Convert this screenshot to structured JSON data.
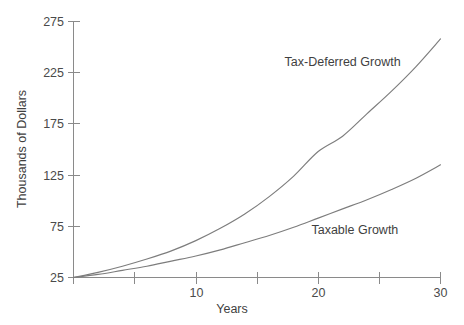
{
  "chart_data": {
    "type": "line",
    "title": "",
    "xlabel": "Years",
    "ylabel": "Thousands of Dollars",
    "xlim": [
      0,
      30
    ],
    "ylim": [
      25,
      275
    ],
    "grid": false,
    "legend_position": "inline-annotation",
    "x_ticks": [
      0,
      5,
      10,
      15,
      20,
      25,
      30
    ],
    "x_tick_labels": [
      "",
      "",
      "10",
      "",
      "20",
      "",
      "30"
    ],
    "y_ticks": [
      25,
      75,
      125,
      175,
      225,
      275
    ],
    "y_tick_labels": [
      "25",
      "75",
      "125",
      "175",
      "225",
      "275"
    ],
    "x": [
      0,
      2,
      4,
      6,
      8,
      10,
      12,
      14,
      16,
      18,
      20,
      22,
      24,
      26,
      28,
      30
    ],
    "series": [
      {
        "name": "Tax-Deferred Growth",
        "color": "#7d7d7d",
        "values": [
          25,
          30,
          36,
          43,
          51,
          61,
          73,
          87,
          104,
          124,
          148,
          163,
          185,
          207,
          231,
          258
        ],
        "label_x": 22,
        "label_y": 232
      },
      {
        "name": "Taxable Growth",
        "color": "#7d7d7d",
        "values": [
          25,
          28,
          32,
          36,
          41,
          46,
          52,
          59,
          66,
          74,
          83,
          92,
          101,
          111,
          122,
          135
        ],
        "label_x": 23,
        "label_y": 68
      }
    ],
    "annotations": [
      {
        "text": "Tax-Deferred Growth",
        "series": "Tax-Deferred Growth"
      },
      {
        "text": "Taxable Growth",
        "series": "Taxable Growth"
      }
    ],
    "axis_color": "#8a8a8a",
    "background": "#ffffff"
  }
}
